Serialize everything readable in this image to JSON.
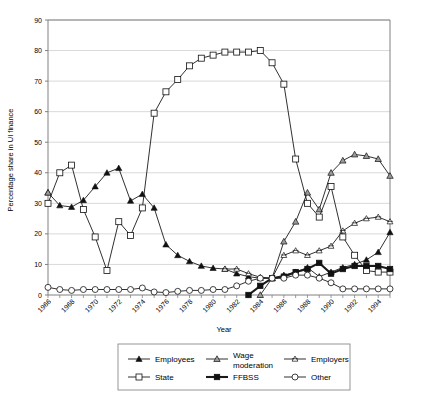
{
  "chart_data": {
    "type": "line",
    "title": "",
    "xlabel": "Year",
    "ylabel": "Percentage share in UI finance",
    "xlim": [
      1966,
      1995
    ],
    "ylim": [
      0,
      90
    ],
    "ytick_step": 10,
    "xtick_step": 2,
    "grid": "horizontal",
    "legend_position": "bottom",
    "x": [
      1966,
      1967,
      1968,
      1969,
      1970,
      1971,
      1972,
      1973,
      1974,
      1975,
      1976,
      1977,
      1978,
      1979,
      1980,
      1981,
      1982,
      1983,
      1984,
      1985,
      1986,
      1987,
      1988,
      1989,
      1990,
      1991,
      1992,
      1993,
      1994,
      1995
    ],
    "xtick_labels": [
      "1966",
      "1968",
      "1970",
      "1972",
      "1974",
      "1976",
      "1978",
      "1980",
      "1982",
      "1984",
      "1986",
      "1988",
      "1990",
      "1992",
      "1994"
    ],
    "ytick_labels": [
      "0",
      "10",
      "20",
      "30",
      "40",
      "50",
      "60",
      "70",
      "80",
      "90"
    ],
    "series": [
      {
        "name": "Employees",
        "marker": "filled-triangle",
        "values": [
          33.5,
          29.3,
          28.8,
          31.0,
          35.5,
          40.0,
          41.5,
          30.8,
          33.0,
          28.5,
          16.5,
          13.0,
          11.0,
          9.5,
          8.8,
          8.5,
          7.0,
          6.0,
          5.5,
          5.5,
          6.5,
          7.5,
          9.0,
          6.0,
          7.5,
          9.0,
          10.0,
          11.5,
          14.0,
          20.5
        ]
      },
      {
        "name": "Wage moderation",
        "marker": "open-triangle-shaded",
        "values": [
          33.5,
          null,
          null,
          null,
          null,
          null,
          null,
          null,
          null,
          null,
          null,
          null,
          null,
          null,
          null,
          null,
          null,
          null,
          0.0,
          5.5,
          17.5,
          24.0,
          33.5,
          28.0,
          40.0,
          44.0,
          46.0,
          45.5,
          44.5,
          39.0
        ]
      },
      {
        "name": "Employers",
        "marker": "star",
        "values": [
          null,
          null,
          null,
          null,
          null,
          null,
          null,
          null,
          null,
          null,
          null,
          null,
          null,
          null,
          null,
          8.5,
          8.5,
          7.0,
          5.8,
          5.5,
          13.0,
          14.5,
          13.0,
          14.5,
          16.0,
          21.0,
          23.5,
          25.0,
          25.5,
          24.0
        ]
      },
      {
        "name": "State",
        "marker": "open-square",
        "values": [
          30.0,
          40.0,
          42.5,
          28.0,
          19.0,
          8.0,
          24.0,
          19.5,
          28.5,
          59.5,
          66.5,
          70.5,
          75.0,
          77.5,
          78.5,
          79.5,
          79.5,
          79.5,
          80.0,
          76.0,
          69.0,
          44.5,
          30.0,
          25.5,
          35.5,
          19.0,
          13.0,
          8.0,
          7.5,
          7.5
        ]
      },
      {
        "name": "FFBSS",
        "marker": "filled-square-bold",
        "values": [
          null,
          null,
          null,
          null,
          null,
          null,
          null,
          null,
          null,
          null,
          null,
          null,
          null,
          null,
          null,
          null,
          null,
          0.0,
          3.0,
          5.5,
          6.0,
          7.5,
          8.5,
          10.5,
          7.0,
          8.5,
          9.5,
          9.5,
          9.5,
          8.5
        ]
      },
      {
        "name": "Other",
        "marker": "open-circle",
        "values": [
          2.5,
          1.8,
          1.5,
          1.8,
          1.8,
          1.8,
          1.8,
          1.8,
          2.3,
          1.0,
          0.8,
          1.2,
          1.5,
          1.5,
          1.8,
          1.8,
          3.0,
          4.5,
          5.5,
          5.5,
          5.5,
          6.5,
          6.5,
          5.5,
          4.0,
          2.0,
          2.0,
          2.0,
          2.0,
          2.0
        ]
      }
    ]
  },
  "legend": {
    "items": [
      {
        "label": "Employees",
        "marker": "filled-triangle"
      },
      {
        "label": "Wage moderation",
        "marker": "open-triangle-shaded"
      },
      {
        "label": "Employers",
        "marker": "star"
      },
      {
        "label": "State",
        "marker": "open-square"
      },
      {
        "label": "FFBSS",
        "marker": "filled-square-bold"
      },
      {
        "label": "Other",
        "marker": "open-circle"
      }
    ]
  },
  "colors": {
    "line": "#1a1a1a",
    "grid": "#c8c8c8",
    "axis": "#808080",
    "marker_fill": "#ffffff",
    "marker_shaded": "#9a9a9a",
    "background": "#ffffff"
  }
}
